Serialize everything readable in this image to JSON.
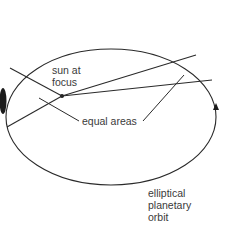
{
  "diagram": {
    "labels": {
      "sun_line1": "sun at",
      "sun_line2": "focus",
      "equal_areas": "equal areas",
      "orbit_line1": "elliptical",
      "orbit_line2": "planetary",
      "orbit_line3": "orbit"
    },
    "colors": {
      "stroke": "#2a2a2a",
      "text": "#3a3a3a",
      "background": "#ffffff"
    }
  }
}
